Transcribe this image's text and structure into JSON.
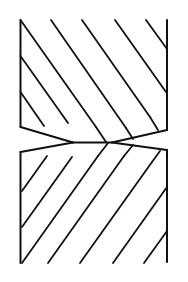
{
  "figure": {
    "background_color": "#ffffff",
    "line_color": "#111111",
    "line_width": 2,
    "canvas": {
      "width": 188,
      "height": 282
    }
  },
  "geometry": {
    "neck": {
      "y": 142,
      "left_x": 73,
      "right_x": 112,
      "label": "neck"
    },
    "upper_block": {
      "left_edge": {
        "x": 20,
        "y_top": 20,
        "y_bottom": 127
      },
      "right_edge": {
        "x": 167,
        "y_top": 20,
        "y_bottom": 130
      }
    },
    "lower_block": {
      "left_edge": {
        "x": 20,
        "y_top": 152,
        "y_bottom": 263
      },
      "right_edge": {
        "x": 167,
        "y_top": 150,
        "y_bottom": 262
      }
    },
    "upper_hatch_direction": "down-right",
    "lower_hatch_direction": "up-right"
  },
  "paths": {
    "upper_left_edge": "M 20.5 20 L 20.5 127",
    "upper_right_edge": "M 167 20 L 167 130",
    "lower_left_edge": "M 20.5 152 L 20.5 263",
    "lower_right_edge": "M 167 150 L 167 262",
    "neck_line": "M 73 142.5 L 112 142.5",
    "upper_left_taper": "M 20.5 127 L 73 142.5",
    "upper_right_taper": "M 167 130 L 112 142.5",
    "lower_left_taper": "M 20.5 152 L 73 142.5",
    "lower_right_taper": "M 167 150 L 112 142.5",
    "upper_hatches": [
      "M 20.5 20 L 96 127",
      "M 20.5 56 L 68 123",
      "M 20.5 92 L 44 126",
      "M 51 20 L 126 128",
      "M 82 20 L 150 117",
      "M 115 20 L 166 92",
      "M 146 20 L 167 49"
    ],
    "upper_taper_hatches": [
      "M 96 127 L 106 142",
      "M 126 128 L 133 139",
      "M 150 117 L 158 130"
    ],
    "lower_hatches": [
      "M 22 263 L 98 156",
      "M 22 227 L 72 157",
      "M 22 191 L 47 156",
      "M 48 263 L 124 156",
      "M 80 263 L 152 162",
      "M 113 263 L 167 187",
      "M 144 263 L 167 231"
    ],
    "lower_taper_hatches": [
      "M 98 156 L 108 143",
      "M 124 156 L 133 145",
      "M 152 162 L 160 151"
    ]
  }
}
